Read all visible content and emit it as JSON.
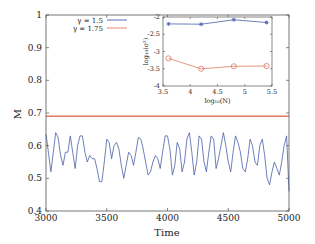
{
  "chart_data": [
    {
      "type": "line",
      "title": "",
      "xlabel": "Time",
      "ylabel": "M",
      "xlim": [
        3000,
        5000
      ],
      "ylim": [
        0.4,
        1.0
      ],
      "xticks": [
        "3000",
        "3500",
        "4000",
        "4500",
        "5000"
      ],
      "yticks": [
        "0.4",
        "0.5",
        "0.6",
        "0.7",
        "0.8",
        "0.9",
        "1"
      ],
      "grid": false,
      "legend_position": "upper-left inside",
      "series": [
        {
          "name": "γ = 1.5",
          "color": "#4a5fa8",
          "x": [
            3000,
            3020,
            3040,
            3060,
            3080,
            3100,
            3120,
            3140,
            3160,
            3180,
            3200,
            3220,
            3240,
            3260,
            3280,
            3300,
            3320,
            3340,
            3360,
            3380,
            3400,
            3420,
            3440,
            3460,
            3480,
            3500,
            3520,
            3540,
            3560,
            3580,
            3600,
            3620,
            3640,
            3660,
            3680,
            3700,
            3720,
            3740,
            3760,
            3780,
            3800,
            3820,
            3840,
            3860,
            3880,
            3900,
            3920,
            3940,
            3960,
            3980,
            4000,
            4020,
            4040,
            4060,
            4080,
            4100,
            4120,
            4140,
            4160,
            4180,
            4200,
            4220,
            4240,
            4260,
            4280,
            4300,
            4320,
            4340,
            4360,
            4380,
            4400,
            4420,
            4440,
            4460,
            4480,
            4500,
            4520,
            4540,
            4560,
            4580,
            4600,
            4620,
            4640,
            4660,
            4680,
            4700,
            4720,
            4740,
            4760,
            4780,
            4800,
            4820,
            4840,
            4860,
            4880,
            4900,
            4920,
            4940,
            4960,
            4980,
            5000
          ],
          "values": [
            0.635,
            0.58,
            0.52,
            0.58,
            0.64,
            0.625,
            0.57,
            0.54,
            0.58,
            0.58,
            0.63,
            0.58,
            0.53,
            0.6,
            0.63,
            0.63,
            0.58,
            0.55,
            0.57,
            0.56,
            0.56,
            0.53,
            0.49,
            0.49,
            0.55,
            0.62,
            0.61,
            0.56,
            0.6,
            0.61,
            0.59,
            0.54,
            0.5,
            0.54,
            0.58,
            0.57,
            0.54,
            0.58,
            0.625,
            0.62,
            0.59,
            0.55,
            0.51,
            0.52,
            0.55,
            0.57,
            0.56,
            0.53,
            0.58,
            0.63,
            0.63,
            0.59,
            0.51,
            0.54,
            0.61,
            0.59,
            0.52,
            0.55,
            0.62,
            0.64,
            0.58,
            0.51,
            0.55,
            0.63,
            0.62,
            0.55,
            0.52,
            0.58,
            0.63,
            0.62,
            0.53,
            0.56,
            0.6,
            0.64,
            0.6,
            0.55,
            0.52,
            0.58,
            0.63,
            0.61,
            0.58,
            0.53,
            0.52,
            0.56,
            0.62,
            0.6,
            0.55,
            0.54,
            0.6,
            0.62,
            0.57,
            0.5,
            0.48,
            0.52,
            0.55,
            0.53,
            0.51,
            0.55,
            0.6,
            0.63,
            0.46
          ]
        },
        {
          "name": "γ = 1.75",
          "color": "#e07a5f",
          "x": [
            3000,
            5000
          ],
          "values": [
            0.69,
            0.69
          ]
        }
      ]
    },
    {
      "type": "line",
      "role": "inset",
      "title": "",
      "xlabel": "log10(N)",
      "ylabel": "log10(σ²)",
      "xlim": [
        3.5,
        5.5
      ],
      "ylim": [
        -4,
        -2
      ],
      "xticks": [
        "3.5",
        "4",
        "4.5",
        "5",
        "5.5"
      ],
      "yticks": [
        "-4",
        "-3.5",
        "-3",
        "-2.5",
        "-2"
      ],
      "grid": false,
      "categories": [
        3.6,
        4.2,
        4.8,
        5.4
      ],
      "series": [
        {
          "name": "γ = 1.5",
          "marker": "asterisk",
          "color": "#4a5fa8",
          "values": [
            -2.2,
            -2.21,
            -2.08,
            -2.16
          ]
        },
        {
          "name": "γ = 1.75",
          "marker": "circle",
          "color": "#e07a5f",
          "values": [
            -3.2,
            -3.5,
            -3.43,
            -3.42
          ]
        }
      ]
    }
  ],
  "labels": {
    "xlabel": "Time",
    "ylabel": "M",
    "legend": [
      "γ = 1.5",
      "γ = 1.75"
    ],
    "inset_xlabel": "log₁₀(N)",
    "inset_ylabel": "log₁₀(σ²)"
  }
}
